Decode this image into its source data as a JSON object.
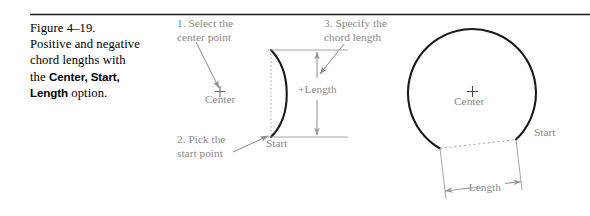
{
  "figure": {
    "caption": {
      "lines": [
        "Figure 4–19.",
        "Positive and negative",
        "chord lengths with"
      ],
      "line4_prefix": "the ",
      "line4_bold": "Center, Start,",
      "line5_bold": "Length",
      "line5_suffix": " option."
    },
    "annotations": {
      "step1": {
        "line1": "1. Select the",
        "line2": "center point"
      },
      "step2": {
        "line1": "2. Pick the",
        "line2": "start point"
      },
      "step3": {
        "line1": "3. Specify the",
        "line2": "chord length"
      }
    },
    "middle_diagram": {
      "center_label": "Center",
      "start_label": "Start",
      "dimension_label": "+Length"
    },
    "right_diagram": {
      "center_label": "Center",
      "start_label": "Start",
      "dimension_label": "–Length"
    },
    "colors": {
      "geometry_black": "#1a1a1a",
      "annotation_gray": "#8a8a8a",
      "dimension_gray": "#9a9a9a",
      "rule_black": "#1a1a1a",
      "background": "#ffffff"
    }
  }
}
